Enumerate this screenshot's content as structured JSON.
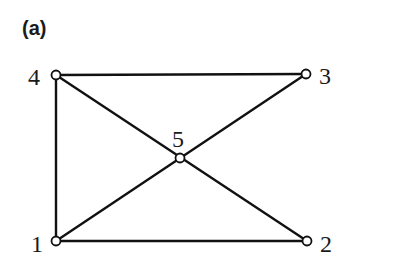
{
  "panel_label": "(a)",
  "graph": {
    "nodes": [
      {
        "id": "1",
        "label": "1",
        "x": 56,
        "y": 241,
        "lx": 31,
        "ly": 252
      },
      {
        "id": "2",
        "label": "2",
        "x": 307,
        "y": 241,
        "lx": 320,
        "ly": 252
      },
      {
        "id": "3",
        "label": "3",
        "x": 306,
        "y": 74,
        "lx": 319,
        "ly": 84
      },
      {
        "id": "4",
        "label": "4",
        "x": 56,
        "y": 75,
        "lx": 28,
        "ly": 85
      },
      {
        "id": "5",
        "label": "5",
        "x": 180,
        "y": 158,
        "lx": 172,
        "ly": 147
      }
    ],
    "edges": [
      [
        "4",
        "3"
      ],
      [
        "4",
        "1"
      ],
      [
        "1",
        "2"
      ],
      [
        "4",
        "2"
      ],
      [
        "1",
        "3"
      ]
    ]
  },
  "colors": {
    "line": "#111111",
    "node_fill": "#ffffff",
    "background": "#ffffff"
  }
}
